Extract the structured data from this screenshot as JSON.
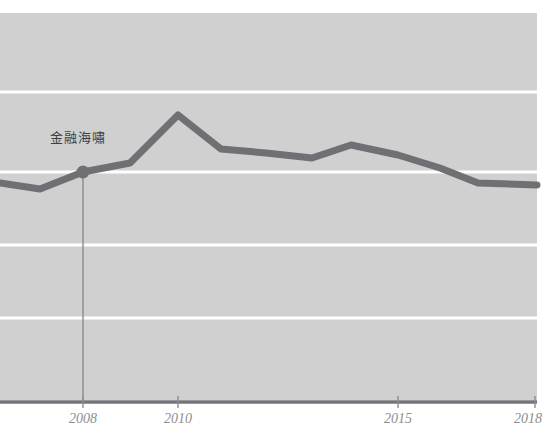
{
  "chart_data": {
    "type": "line",
    "title": "",
    "subtitle": "",
    "xlabel": "",
    "ylabel": "",
    "grid": true,
    "legend": "none",
    "xlim": [
      2006,
      2018
    ],
    "ylim": [
      0,
      100
    ],
    "x_tick_labels": [
      "2008",
      "2010",
      "2015",
      "2018"
    ],
    "x_tick_values": [
      2008,
      2010,
      2015,
      2018
    ],
    "y_tick_labels": [],
    "gridline_count": 4,
    "series": [
      {
        "name": "trend",
        "color": "#6f7073",
        "x": [
          2006.0,
          2006.6,
          2007.3,
          2008.0,
          2008.6,
          2009.3,
          2010.0,
          2010.6,
          2011.2,
          2012.0,
          2012.9,
          2013.5,
          2014.2,
          2015.2,
          2016.2,
          2017.2,
          2018.0
        ],
        "values": [
          54.5,
          53.5,
          52.0,
          57.5,
          59.5,
          62.5,
          72.0,
          63.0,
          61.5,
          60.5,
          59.0,
          60.5,
          62.0,
          58.0,
          54.0,
          52.5,
          52.0
        ]
      }
    ],
    "annotations": [
      {
        "label": "金融海嘯",
        "x": 2008,
        "y": 57.5,
        "marker": "dot",
        "marker_color": "#6f7073",
        "connector": "vertical-line-to-axis"
      }
    ]
  },
  "colors": {
    "page_background": "#ffffff",
    "plot_background": "#cfcfd0",
    "gridline": "#ffffff",
    "axis_line": "#74747a",
    "series_line": "#6f7073",
    "marker": "#6f7073",
    "annotation_text": "#3f3f42",
    "tick_text": "#8d8d90",
    "connector_line": "#8a8a8f"
  },
  "layout": {
    "width": 545,
    "height": 441,
    "plot_left": 0,
    "plot_right": 537,
    "plot_top": 13,
    "plot_bottom": 400,
    "axis_y": 402,
    "gridlines_y": [
      92,
      172,
      245,
      318
    ],
    "tick_positions_x": [
      83,
      178,
      398,
      535
    ],
    "tick_label_y": 412,
    "annotation_label_x": 50,
    "annotation_label_y": 131,
    "marker_x": 83,
    "marker_y": 172,
    "marker_radius": 6.5,
    "line_width": 7
  },
  "line_points": "0,183 40,189 83,172 130,163 178,115 221,149 266,153 312,158 351,145 398,155 440,168 478,183 537,185",
  "ticks": [
    {
      "label": "2008",
      "x": 83
    },
    {
      "label": "2010",
      "x": 178
    },
    {
      "label": "2015",
      "x": 398
    },
    {
      "label": "2018",
      "x": 535
    }
  ]
}
